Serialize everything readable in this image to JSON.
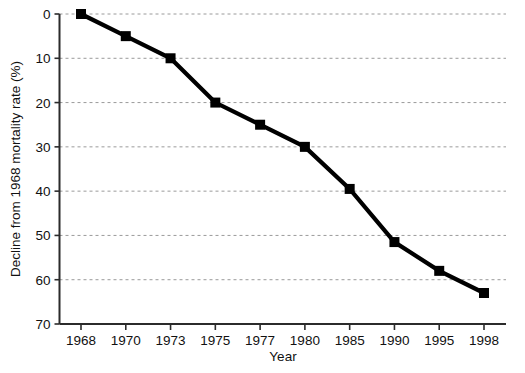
{
  "chart_data": {
    "type": "line",
    "title": "",
    "xlabel": "Year",
    "ylabel": "Decline from 1968 mortality rate (%)",
    "categories": [
      "1968",
      "1970",
      "1973",
      "1975",
      "1977",
      "1980",
      "1985",
      "1990",
      "1995",
      "1998"
    ],
    "values": [
      0,
      5,
      10,
      20,
      25,
      30,
      39.5,
      51.5,
      58,
      63
    ],
    "ylim": [
      0,
      70
    ],
    "y_inverted": true,
    "y_ticks": [
      "0",
      "10",
      "20",
      "30",
      "40",
      "50",
      "60",
      "70"
    ],
    "y_tick_values": [
      0,
      10,
      20,
      30,
      40,
      50,
      60,
      70
    ],
    "grid": "horizontal-dotted",
    "legend": "none",
    "series": [
      {
        "name": "Decline from 1968 mortality rate",
        "marker": "square",
        "color": "#000000",
        "values": [
          0,
          5,
          10,
          20,
          25,
          30,
          39.5,
          51.5,
          58,
          63
        ]
      }
    ]
  },
  "axes": {
    "y_title": "Decline from 1968 mortality rate (%)",
    "x_title": "Year"
  },
  "colors": {
    "line": "#000000",
    "marker": "#000000",
    "grid": "#9a9a9a",
    "axis": "#2b2b2b",
    "background": "#ffffff"
  }
}
